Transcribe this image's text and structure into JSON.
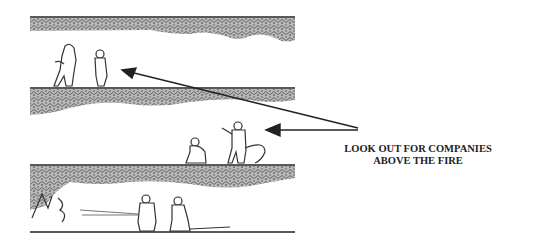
{
  "diagram": {
    "type": "illustration",
    "floors": [
      {
        "level": "upper",
        "figures": 2,
        "activity": "standing"
      },
      {
        "level": "middle",
        "figures": 2,
        "activity": "operating hose line above the fire"
      },
      {
        "level": "lower",
        "figures": 2,
        "activity": "attacking fire with hose stream"
      }
    ],
    "fire_location": "lower floor, left side",
    "arrows": [
      {
        "from": "caption",
        "to": "upper-floor-figures"
      },
      {
        "from": "caption",
        "to": "middle-floor-figures"
      }
    ],
    "caption": {
      "line1": "LOOK OUT FOR COMPANIES",
      "line2": "ABOVE THE FIRE"
    },
    "colors": {
      "line": "#222222",
      "texture": "#8a8a8a",
      "background": "#ffffff"
    }
  }
}
